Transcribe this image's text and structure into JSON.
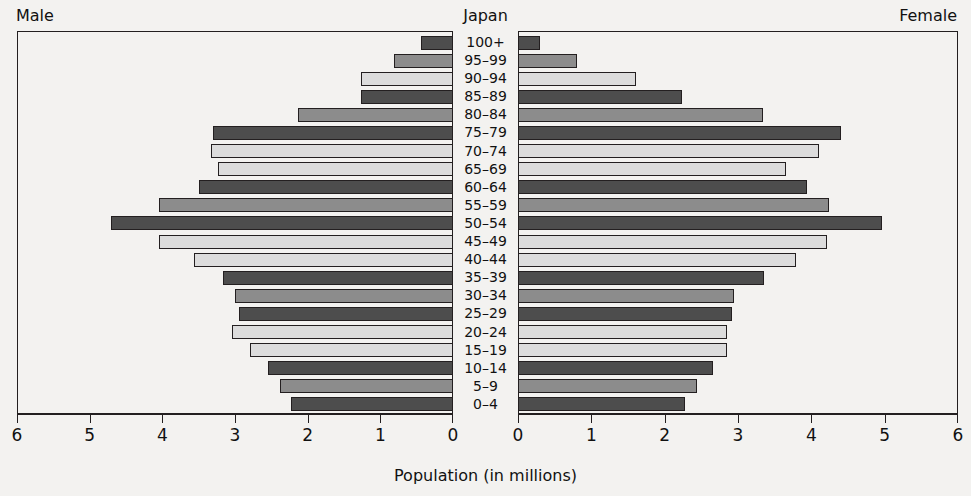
{
  "header": {
    "male_label": "Male",
    "female_label": "Female",
    "country_title": "Japan"
  },
  "axis": {
    "caption": "Population (in millions)",
    "unit": "millions",
    "male_ticks": [
      "6",
      "5",
      "4",
      "3",
      "2",
      "1",
      "0"
    ],
    "female_ticks": [
      "0",
      "1",
      "2",
      "3",
      "4",
      "5",
      "6"
    ],
    "max": 6,
    "min": 0
  },
  "colors": {
    "dark": "#4d4d4d",
    "mid": "#8c8c8c",
    "light": "#dcdcdc",
    "outline": "#231f20",
    "background": "#f3f2f0"
  },
  "chart_data": {
    "type": "bar",
    "subtype": "population-pyramid",
    "title": "Japan",
    "xlabel": "Population (in millions)",
    "ylabel": "",
    "xlim": [
      0,
      6
    ],
    "grid": false,
    "legend": null,
    "categories": [
      "100+",
      "95–99",
      "90–94",
      "85–89",
      "80–84",
      "75–79",
      "70–74",
      "65–69",
      "60–64",
      "55–59",
      "50–54",
      "45–49",
      "40–44",
      "35–39",
      "30–34",
      "25–29",
      "20–24",
      "15–19",
      "10–14",
      "5–9",
      "0–4"
    ],
    "series": [
      {
        "name": "Male",
        "side": "left",
        "values": [
          0.44,
          0.81,
          1.27,
          1.27,
          2.14,
          3.32,
          3.35,
          3.25,
          3.51,
          4.07,
          4.73,
          4.07,
          3.58,
          3.18,
          3.01,
          2.96,
          3.05,
          2.81,
          2.56,
          2.39,
          2.24
        ]
      },
      {
        "name": "Female",
        "side": "right",
        "values": [
          0.3,
          0.81,
          1.62,
          2.25,
          3.36,
          4.42,
          4.13,
          3.67,
          3.96,
          4.26,
          4.98,
          4.23,
          3.81,
          3.37,
          2.96,
          2.93,
          2.86,
          2.86,
          2.67,
          2.45,
          2.29
        ]
      }
    ],
    "shades": [
      "dark",
      "mid",
      "light",
      "dark",
      "mid",
      "dark",
      "light",
      "light",
      "dark",
      "mid",
      "dark",
      "light",
      "light",
      "dark",
      "mid",
      "dark",
      "light",
      "light",
      "dark",
      "mid",
      "dark"
    ]
  }
}
